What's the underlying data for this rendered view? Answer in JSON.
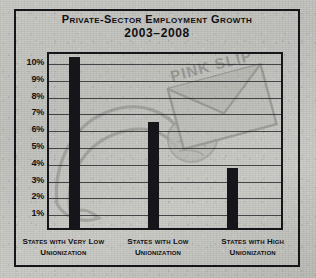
{
  "chart_data": {
    "type": "bar",
    "title": "Private-Sector Employment Growth",
    "subtitle": "2003–2008",
    "xlabel": "",
    "ylabel": "",
    "categories": [
      "States with Very Low Unionization",
      "States with Low Unionization",
      "States with High Unionization"
    ],
    "values": [
      10.2,
      6.3,
      3.55
    ],
    "ylim": [
      0,
      10.6
    ],
    "yticks": [
      1,
      2,
      3,
      4,
      5,
      6,
      7,
      8,
      9,
      10
    ],
    "ytick_labels": [
      "1%",
      "2%",
      "3%",
      "4%",
      "5%",
      "6%",
      "7%",
      "8%",
      "9%",
      "10%"
    ],
    "grid": true,
    "legend": "none",
    "bar_color": "#16161a",
    "annotations": [
      "PINK SLIP"
    ]
  },
  "watermark": {
    "envelope_text": "Pink Slip",
    "description": "faded illustration of an arm holding a pink slip envelope"
  },
  "colors": {
    "ink": "#15151a",
    "paper": "#c6c6c2",
    "bar": "#16161a"
  }
}
